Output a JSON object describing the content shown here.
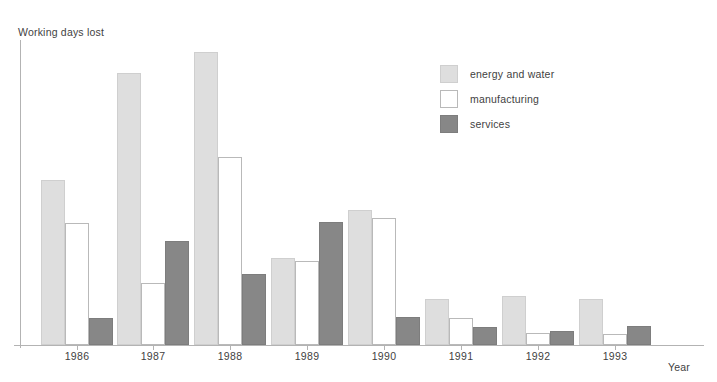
{
  "chart_data": {
    "type": "bar",
    "title": "",
    "subtitle": "",
    "ylabel": "Working days lost",
    "xlabel": "Year",
    "categories": [
      "1986",
      "1987",
      "1988",
      "1989",
      "1990",
      "1991",
      "1992",
      "1993"
    ],
    "series": [
      {
        "name": "energy and water",
        "color": "#dedede",
        "values": [
          165,
          272,
          293,
          87,
          135,
          46,
          49,
          46
        ]
      },
      {
        "name": "manufacturing",
        "color": "#ffffff",
        "values": [
          122,
          62,
          188,
          84,
          127,
          27,
          12,
          11
        ]
      },
      {
        "name": "services",
        "color": "#878787",
        "values": [
          27,
          104,
          71,
          123,
          28,
          18,
          14,
          19
        ]
      }
    ],
    "ylim": [
      0,
      305
    ],
    "yticks": [],
    "grid": false,
    "legend_position": "upper-right",
    "axis_color": "#b3b3b3"
  },
  "legend": {
    "items": [
      {
        "label": "energy and water",
        "swatch": "energy"
      },
      {
        "label": "manufacturing",
        "swatch": "manufacturing"
      },
      {
        "label": "services",
        "swatch": "services"
      }
    ]
  },
  "axes": {
    "y_title": "Working days lost",
    "x_title": "Year"
  }
}
